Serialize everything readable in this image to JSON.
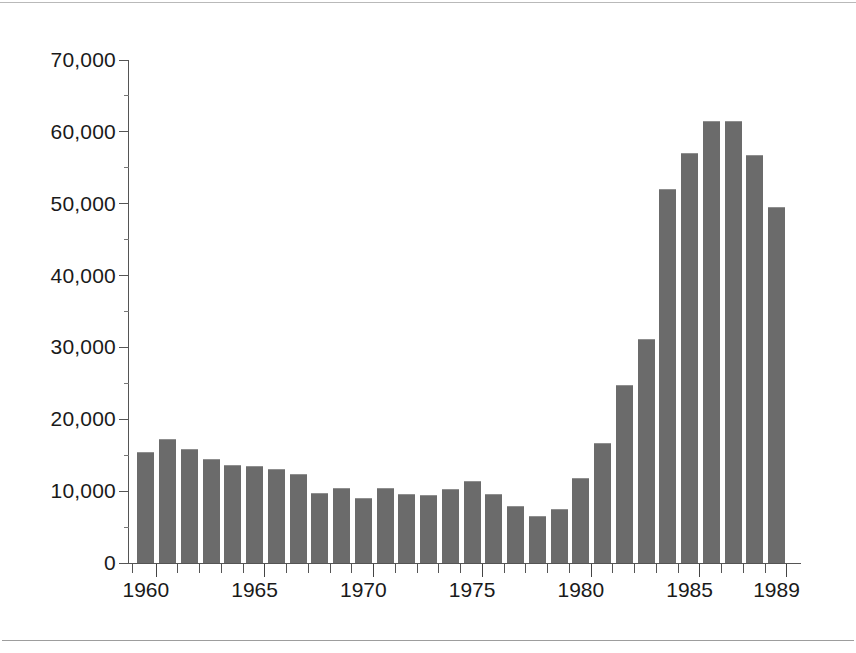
{
  "figure": {
    "background_color": "#ffffff",
    "bar_color": "#6b6b6b",
    "axis_color": "#555555",
    "rule_color": "#9d9d9d"
  },
  "chart_data": {
    "type": "bar",
    "title": "",
    "subtitle": "",
    "xlabel": "",
    "ylabel": "",
    "grid": false,
    "legend": null,
    "ylim": [
      0,
      70000
    ],
    "ytick_values": [
      0,
      10000,
      20000,
      30000,
      40000,
      50000,
      60000,
      70000
    ],
    "ytick_labels": [
      "0",
      "10,000",
      "20,000",
      "30,000",
      "40,000",
      "50,000",
      "60,000",
      "70,000"
    ],
    "y_minor_interval": 5000,
    "xlim": [
      1960,
      1989
    ],
    "xtick_labels": [
      "1960",
      "1965",
      "1970",
      "1975",
      "1980",
      "1985",
      "1989"
    ],
    "xtick_years": [
      1960,
      1965,
      1970,
      1975,
      1980,
      1985,
      1989
    ],
    "categories": [
      "1960",
      "1961",
      "1962",
      "1963",
      "1964",
      "1965",
      "1966",
      "1967",
      "1968",
      "1969",
      "1970",
      "1971",
      "1972",
      "1973",
      "1974",
      "1975",
      "1976",
      "1977",
      "1978",
      "1979",
      "1980",
      "1981",
      "1982",
      "1983",
      "1984",
      "1985",
      "1986",
      "1987",
      "1988",
      "1989"
    ],
    "values": [
      15500,
      17300,
      15900,
      14500,
      13600,
      13500,
      13100,
      12400,
      9700,
      10400,
      9000,
      10400,
      9600,
      9400,
      10300,
      11400,
      9600,
      8000,
      6600,
      7500,
      11800,
      16700,
      24800,
      31200,
      52000,
      57000,
      61500,
      61500,
      56800,
      49600
    ]
  }
}
